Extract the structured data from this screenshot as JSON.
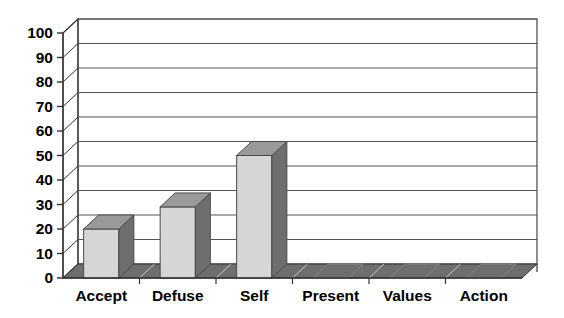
{
  "chart_data": {
    "type": "bar",
    "title": "",
    "subtitle": "",
    "xlabel": "",
    "ylabel": "",
    "categories": [
      "Accept",
      "Defuse",
      "Self",
      "Present",
      "Values",
      "Action"
    ],
    "values": [
      20,
      29,
      50,
      0,
      0,
      0
    ],
    "ylim": [
      0,
      100
    ],
    "ytick_labels": [
      "0",
      "10",
      "20",
      "30",
      "40",
      "50",
      "60",
      "70",
      "80",
      "90",
      "100"
    ],
    "ytick_values": [
      0,
      10,
      20,
      30,
      40,
      50,
      60,
      70,
      80,
      90,
      100
    ],
    "grid": true,
    "grid_axis": "y",
    "legend": false,
    "legend_position": "none",
    "three_d": true,
    "series": [
      {
        "name": "Series 1",
        "values": [
          20,
          29,
          50,
          0,
          0,
          0
        ]
      }
    ],
    "annotations": []
  },
  "style": {
    "bar_face_color": "#d6d6d6",
    "bar_side_color": "#6e6e6e",
    "bar_top_color": "#9a9a9a",
    "floor_color": "#6e6e6e",
    "wall_color": "#ffffff",
    "axis_color": "#333333",
    "grid_color": "#555555",
    "text_color": "#000000",
    "background_color": "#ffffff"
  }
}
